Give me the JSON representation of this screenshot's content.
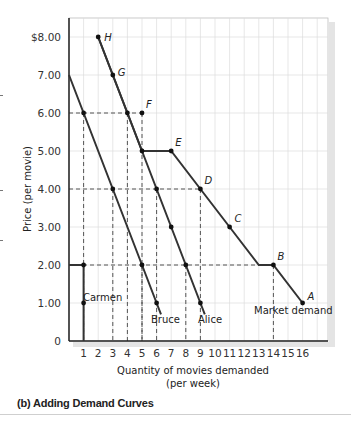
{
  "chart_data": {
    "type": "line",
    "title": "",
    "caption": "(b)  Adding Demand Curves",
    "xlabel": "Quantity of movies demanded",
    "xlabel_sub": "(per week)",
    "ylabel": "Price (per movie)",
    "xlim": [
      0,
      17
    ],
    "ylim": [
      0,
      8.5
    ],
    "x_ticks": [
      "1",
      "2",
      "3",
      "4",
      "5",
      "6",
      "7",
      "8",
      "9",
      "10",
      "11",
      "12",
      "13",
      "14",
      "15",
      "16"
    ],
    "y_ticks": [
      "0",
      "1.00",
      "2.00",
      "3.00",
      "4.00",
      "5.00",
      "6.00",
      "7.00",
      "$8.00"
    ],
    "grid": true,
    "series": [
      {
        "name": "Carmen",
        "points": [
          [
            0,
            2
          ],
          [
            1,
            2
          ],
          [
            1,
            1
          ],
          [
            1,
            0
          ]
        ]
      },
      {
        "name": "Bruce",
        "points": [
          [
            0,
            7
          ],
          [
            1,
            6
          ],
          [
            3,
            4
          ],
          [
            5,
            2
          ],
          [
            6,
            1
          ],
          [
            6.3,
            0.7
          ]
        ]
      },
      {
        "name": "Alice",
        "points": [
          [
            2,
            8
          ],
          [
            3,
            7
          ],
          [
            4,
            6
          ],
          [
            5,
            5
          ],
          [
            6,
            4
          ],
          [
            7,
            3
          ],
          [
            8,
            2
          ],
          [
            9,
            1
          ],
          [
            9.3,
            0.7
          ]
        ]
      },
      {
        "name": "Market demand",
        "points": [
          [
            2,
            8
          ],
          [
            3,
            7
          ],
          [
            4,
            6
          ],
          [
            5,
            5
          ],
          [
            7,
            5
          ],
          [
            9,
            4
          ],
          [
            11,
            3
          ],
          [
            13,
            2
          ],
          [
            14,
            2
          ],
          [
            16,
            1
          ]
        ]
      }
    ],
    "labeled_points": [
      {
        "label": "H",
        "x": 2,
        "y": 8
      },
      {
        "label": "G",
        "x": 3,
        "y": 7
      },
      {
        "label": "F",
        "x": 5,
        "y": 6
      },
      {
        "label": "E",
        "x": 7,
        "y": 5
      },
      {
        "label": "D",
        "x": 9,
        "y": 4
      },
      {
        "label": "C",
        "x": 11,
        "y": 3
      },
      {
        "label": "B",
        "x": 14,
        "y": 2
      },
      {
        "label": "A",
        "x": 16,
        "y": 1
      }
    ],
    "reference_dashed_lines": [
      {
        "price": 6,
        "quantities": [
          1,
          4,
          5
        ]
      },
      {
        "price": 4,
        "quantities": [
          3,
          6,
          9
        ]
      },
      {
        "price": 2,
        "quantities": [
          1,
          5,
          8,
          14
        ]
      }
    ],
    "curve_labels": [
      "Carmen",
      "Bruce",
      "Alice",
      "Market demand"
    ]
  }
}
